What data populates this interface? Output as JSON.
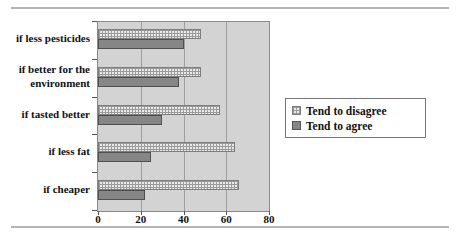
{
  "chart_data": {
    "type": "bar",
    "orientation": "horizontal",
    "title": "",
    "xlabel": "",
    "ylabel": "",
    "categories": [
      "if less pesticides",
      "if better for the environment",
      "if tasted better",
      "if less fat",
      "if cheaper"
    ],
    "series": [
      {
        "name": "Tend to disagree",
        "style": "hatched",
        "values": [
          48,
          48,
          57,
          64,
          66
        ]
      },
      {
        "name": "Tend to agree",
        "style": "solid",
        "values": [
          40,
          38,
          30,
          25,
          22
        ]
      }
    ],
    "x_ticks": [
      "0",
      "20",
      "40",
      "60",
      "80"
    ],
    "x_tick_values": [
      0,
      20,
      40,
      60,
      80
    ],
    "xlim": [
      0,
      80
    ],
    "grid": true,
    "legend_position": "right"
  },
  "legend": {
    "items": [
      {
        "label": "Tend to disagree",
        "swatch": "hatched"
      },
      {
        "label": "Tend to agree",
        "swatch": "solid"
      }
    ]
  },
  "colors": {
    "plot_bg": "#d3d3d3",
    "plot_border": "#8a8a8a",
    "gridline": "#9e9e9e",
    "bar_solid": "#868686",
    "bar_border": "#4f4f4f",
    "hatch_bg": "#eaeaea",
    "hatch_line": "#9a9a9a",
    "rule": "#b5b5b5"
  }
}
